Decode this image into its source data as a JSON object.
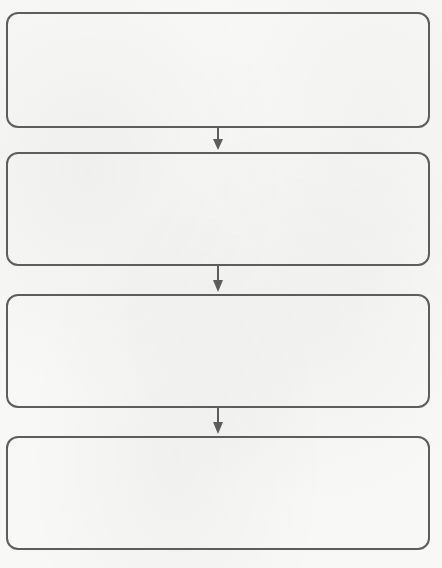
{
  "diagram": {
    "type": "flowchart",
    "direction": "top-to-bottom",
    "title_fragment": "y",
    "stroke_color": "#5d5d5d",
    "background_color": "#f8f8f6",
    "steps": [
      {
        "id": "step-1",
        "text": ""
      },
      {
        "id": "step-2",
        "text": ""
      },
      {
        "id": "step-3",
        "text": ""
      },
      {
        "id": "step-4",
        "text": ""
      }
    ],
    "connectors": [
      {
        "from": "step-1",
        "to": "step-2",
        "style": "arrow-down"
      },
      {
        "from": "step-2",
        "to": "step-3",
        "style": "arrow-down"
      },
      {
        "from": "step-3",
        "to": "step-4",
        "style": "arrow-down"
      }
    ]
  }
}
